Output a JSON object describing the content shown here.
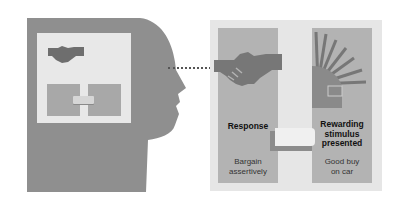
{
  "diagram": {
    "head": {
      "inner_box": {
        "icon": "handshake-icon",
        "mini_panels": 2
      }
    },
    "response": {
      "title": "Response",
      "description_line1": "Bargain",
      "description_line2": "assertively",
      "icon": "handshake-icon"
    },
    "reward": {
      "title_line1": "Rewarding",
      "title_line2": "stimulus",
      "title_line3": "presented",
      "description_line1": "Good buy",
      "description_line2": "on car",
      "icon": "sunburst-car-icon"
    },
    "colors": {
      "head": "#8f8f8f",
      "inner_box": "#e8e8e8",
      "panel_bg": "#e6e6e6",
      "panel": "#b3b3b3",
      "icon_dark": "#777777"
    }
  }
}
